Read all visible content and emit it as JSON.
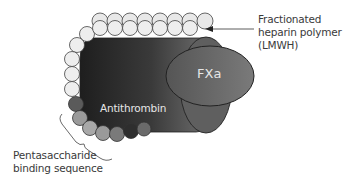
{
  "diagram": {
    "labels": {
      "heparin_polymer": [
        "Fractionated",
        "heparin polymer",
        "(LMWH)"
      ],
      "pentasaccharide": [
        "Pentasaccharide",
        "binding sequence"
      ],
      "antithrombin": "Antithrombin",
      "fxa": "FXa"
    },
    "colors": {
      "antithrombin_dark": "#2a2a2a",
      "antithrombin_light": "#6a6a6a",
      "fxa_fill": "#6e6e6e",
      "bead_light": "#ececec",
      "bead_mid": "#9a9a9a",
      "bead_dark": "#5a5a5a",
      "bead_darkest": "#333333",
      "outline": "#333333"
    }
  }
}
